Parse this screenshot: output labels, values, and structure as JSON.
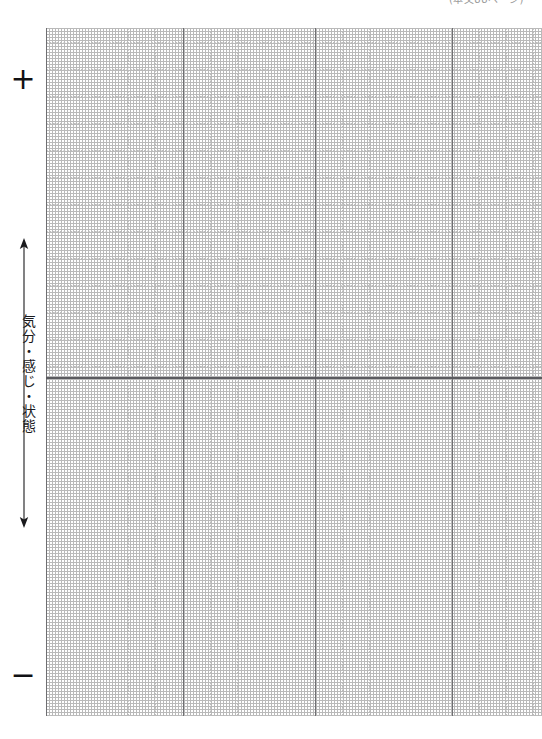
{
  "page": {
    "width": 542,
    "height": 739,
    "background_color": "#ffffff",
    "kind": "blank-plotting-worksheet"
  },
  "reference_note": {
    "text": "(本文88ページ)"
  },
  "axis": {
    "positive_sign": "+",
    "negative_sign": "−",
    "label": "気分・感じ・状態",
    "arrow": "double-headed-vertical-arrow",
    "arrow_top_direction": "up",
    "arrow_bottom_direction": "down"
  },
  "chart_data": {
    "type": "line",
    "title": "",
    "subtitle": "",
    "xlabel": "",
    "ylabel": "気分・感じ・状態",
    "series": [
      {
        "name": "",
        "values": []
      }
    ],
    "x": [],
    "categories": [],
    "ylim": [
      -1,
      1
    ],
    "xlim": [
      0,
      18.4
    ],
    "grid": true,
    "legend": "none",
    "annotations": [
      "+",
      "−",
      "(本文88ページ)"
    ],
    "grid_geometry": {
      "origin_x": 46,
      "origin_y": 28,
      "grid_right": 542,
      "grid_bottom": 716,
      "minor_cell_px": 27.2,
      "baseline_y": 377,
      "major_vertical_x": [
        46,
        183,
        315,
        452
      ],
      "minor_vertical_x": [
        73,
        100,
        128,
        155,
        210,
        237,
        265,
        292,
        342,
        369,
        397,
        424,
        479,
        506,
        533
      ],
      "minor_horizontal_y": [
        42,
        69,
        96,
        123,
        150,
        177,
        204,
        231,
        258,
        285,
        312,
        339,
        366,
        377,
        391,
        418,
        445,
        472,
        499,
        526,
        553,
        580,
        607,
        634,
        661,
        688,
        715
      ]
    }
  }
}
